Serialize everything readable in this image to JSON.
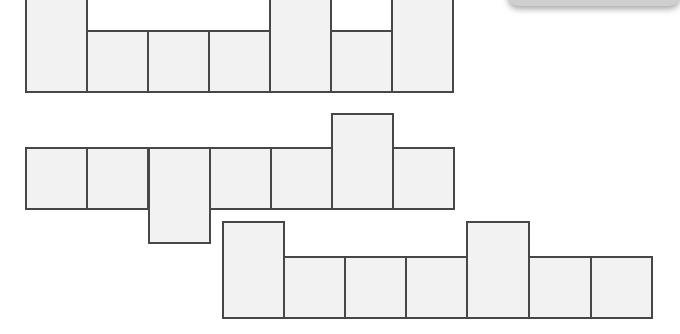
{
  "diagram": {
    "colors": {
      "fill": "#f2f2f2",
      "stroke": "#474747",
      "background": "#ffffff"
    },
    "cell_size": 61,
    "nets": [
      {
        "id": "net-1",
        "description": "Row of 7 squares; squares 1, 5 and 7 extend upward",
        "squares": [
          {
            "x": 25,
            "y": -5,
            "w": 63,
            "h": 98
          },
          {
            "x": 86,
            "y": 30,
            "w": 63,
            "h": 63
          },
          {
            "x": 147,
            "y": 30,
            "w": 63,
            "h": 63
          },
          {
            "x": 208,
            "y": 30,
            "w": 63,
            "h": 63
          },
          {
            "x": 269,
            "y": -5,
            "w": 63,
            "h": 98
          },
          {
            "x": 330,
            "y": 30,
            "w": 63,
            "h": 63
          },
          {
            "x": 391,
            "y": -5,
            "w": 63,
            "h": 98
          }
        ]
      },
      {
        "id": "net-2",
        "description": "Row of 7 squares; square 3 extends downward, square 6 extends upward",
        "squares": [
          {
            "x": 25,
            "y": 147,
            "w": 63,
            "h": 63
          },
          {
            "x": 86,
            "y": 147,
            "w": 63,
            "h": 63
          },
          {
            "x": 148,
            "y": 147,
            "w": 63,
            "h": 97
          },
          {
            "x": 209,
            "y": 147,
            "w": 63,
            "h": 63
          },
          {
            "x": 270,
            "y": 147,
            "w": 63,
            "h": 63
          },
          {
            "x": 331,
            "y": 113,
            "w": 63,
            "h": 97
          },
          {
            "x": 392,
            "y": 147,
            "w": 63,
            "h": 63
          }
        ]
      },
      {
        "id": "net-3",
        "description": "Row of 7 squares; squares 1 and 5 extend upward",
        "squares": [
          {
            "x": 222,
            "y": 221,
            "w": 63,
            "h": 98
          },
          {
            "x": 283,
            "y": 256,
            "w": 63,
            "h": 63
          },
          {
            "x": 344,
            "y": 256,
            "w": 63,
            "h": 63
          },
          {
            "x": 405,
            "y": 256,
            "w": 63,
            "h": 63
          },
          {
            "x": 466,
            "y": 221,
            "w": 64,
            "h": 98
          },
          {
            "x": 528,
            "y": 256,
            "w": 64,
            "h": 63
          },
          {
            "x": 590,
            "y": 256,
            "w": 63,
            "h": 63
          }
        ]
      }
    ]
  }
}
